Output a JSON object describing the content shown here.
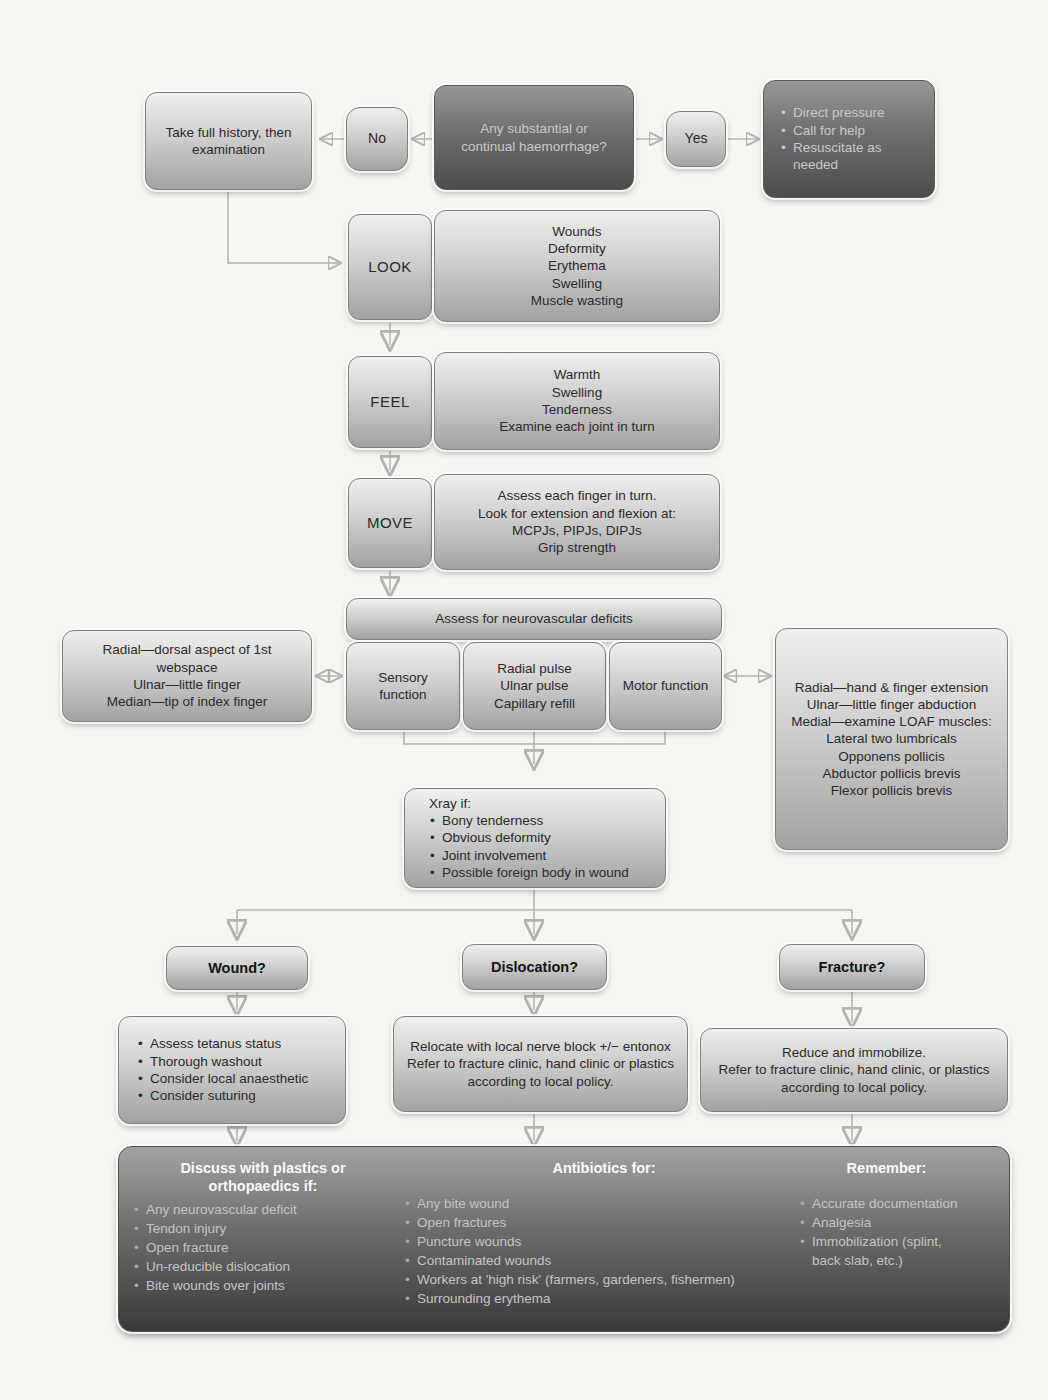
{
  "colors": {
    "page_background": "#f7f6f3",
    "box_light_top": "#f0efee",
    "box_light_bottom": "#a2a2a2",
    "box_dark_top": "#979797",
    "box_dark_bottom": "#4c4c4c",
    "arrow": "#b3b3b3",
    "footer_header_text": "#fafafa",
    "footer_item_text": "#c4c4c4"
  },
  "triage": {
    "history": "Take full history, then examination",
    "no": "No",
    "question": "Any substantial or continual haemorrhage?",
    "yes": "Yes",
    "emergency_items": [
      "Direct pressure",
      "Call for help",
      "Resuscitate as needed"
    ]
  },
  "exam": {
    "look_label": "LOOK",
    "look_items": [
      "Wounds",
      "Deformity",
      "Erythema",
      "Swelling",
      "Muscle wasting"
    ],
    "feel_label": "FEEL",
    "feel_items": [
      "Warmth",
      "Swelling",
      "Tenderness",
      "Examine each joint in turn"
    ],
    "move_label": "MOVE",
    "move_items": [
      "Assess each finger in turn.",
      "Look for extension and flexion at:",
      "MCPJs, PIPJs, DIPJs",
      "Grip strength"
    ]
  },
  "neurovascular": {
    "header": "Assess for neurovascular deficits",
    "sensory": "Sensory function",
    "vascular_items": [
      "Radial pulse",
      "Ulnar pulse",
      "Capillary refill"
    ],
    "motor": "Motor function",
    "sensory_detail": [
      "Radial—dorsal aspect of 1st webspace",
      "Ulnar—little finger",
      "Median—tip of index finger"
    ],
    "motor_detail": [
      "Radial—hand & finger extension",
      "Ulnar—little finger abduction",
      "Medial—examine LOAF muscles:",
      "Lateral two lumbricals",
      "Opponens pollicis",
      "Abductor pollicis brevis",
      "Flexor pollicis brevis"
    ]
  },
  "xray": {
    "title": "Xray if:",
    "items": [
      "Bony tenderness",
      "Obvious deformity",
      "Joint involvement",
      "Possible foreign body in wound"
    ]
  },
  "branches": {
    "wound_header": "Wound?",
    "wound_items": [
      "Assess tetanus status",
      "Thorough washout",
      "Consider local anaesthetic",
      "Consider suturing"
    ],
    "dislocation_header": "Dislocation?",
    "dislocation_lines": [
      "Relocate with local nerve block +/− entonox",
      "Refer to fracture clinic, hand clinic or plastics according to local policy."
    ],
    "fracture_header": "Fracture?",
    "fracture_lines": [
      "Reduce and immobilize.",
      "Refer to fracture clinic, hand clinic, or plastics according to local policy."
    ]
  },
  "footer": {
    "discuss_header": "Discuss with plastics or orthopaedics if:",
    "discuss_items": [
      "Any neurovascular deficit",
      "Tendon injury",
      "Open fracture",
      "Un-reducible dislocation",
      "Bite wounds over joints"
    ],
    "antibiotics_header": "Antibiotics for:",
    "antibiotics_items": [
      "Any bite wound",
      "Open fractures",
      "Puncture wounds",
      "Contaminated wounds",
      "Workers at 'high risk' (farmers, gardeners, fishermen)",
      "Surrounding erythema"
    ],
    "remember_header": "Remember:",
    "remember_items": [
      "Accurate documentation",
      "Analgesia",
      "Immobilization (splint, back slab, etc.)"
    ]
  }
}
